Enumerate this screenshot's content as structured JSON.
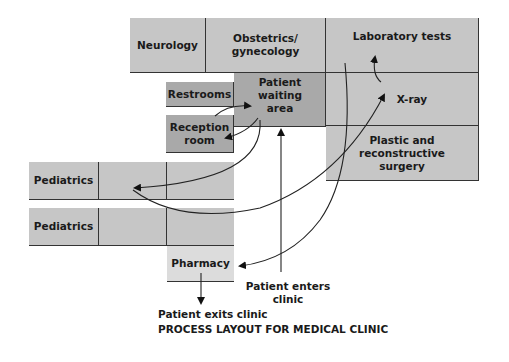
{
  "diagram": {
    "title": "PROCESS LAYOUT FOR MEDICAL CLINIC",
    "departments": {
      "neurology": "Neurology",
      "obstetrics": "Obstetrics/ gynecology",
      "laboratory": "Laboratory tests",
      "waiting": "Patient waiting area",
      "restrooms": "Restrooms",
      "reception": "Reception room",
      "xray": "X-ray",
      "plastic": "Plastic and reconstructive surgery",
      "pediatrics1": "Pediatrics",
      "pediatrics2": "Pediatrics",
      "pharmacy": "Pharmacy"
    },
    "annotations": {
      "enters": "Patient enters clinic",
      "exits": "Patient exits clinic"
    },
    "colors": {
      "room": "#c6c6c6",
      "waiting": "#a9a9a9",
      "pharmacy": "#dcdcdc",
      "line": "#333333"
    }
  }
}
